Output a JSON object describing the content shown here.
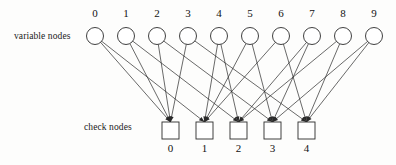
{
  "figure": {
    "type": "tanner-graph",
    "variable_nodes_label": "variable nodes",
    "check_nodes_label": "check nodes",
    "background_color": "#fdfdfc",
    "line_color": "#2a2a2a",
    "node_fill": "#ffffff",
    "node_stroke": "#2b2b2b"
  },
  "variable_nodes": {
    "count": 10,
    "labels": [
      "0",
      "1",
      "2",
      "3",
      "4",
      "5",
      "6",
      "7",
      "8",
      "9"
    ],
    "radius": 8.5,
    "center_y": 36,
    "label_y": 17,
    "x_positions": [
      95,
      126,
      157,
      188,
      219,
      250,
      281,
      312,
      343,
      374
    ]
  },
  "check_nodes": {
    "count": 5,
    "labels": [
      "0",
      "1",
      "2",
      "3",
      "4"
    ],
    "box_size": 17,
    "box_top": 122,
    "label_y": 152,
    "x_positions": [
      162,
      196,
      230,
      264,
      298
    ]
  },
  "chart_data": {
    "type": "diagram",
    "variable_node_degree": 2,
    "check_node_degree": 4,
    "edges": [
      {
        "variable": 0,
        "check": 0
      },
      {
        "variable": 0,
        "check": 1
      },
      {
        "variable": 1,
        "check": 0
      },
      {
        "variable": 1,
        "check": 2
      },
      {
        "variable": 2,
        "check": 0
      },
      {
        "variable": 2,
        "check": 3
      },
      {
        "variable": 3,
        "check": 0
      },
      {
        "variable": 3,
        "check": 4
      },
      {
        "variable": 4,
        "check": 1
      },
      {
        "variable": 4,
        "check": 2
      },
      {
        "variable": 5,
        "check": 1
      },
      {
        "variable": 5,
        "check": 3
      },
      {
        "variable": 6,
        "check": 1
      },
      {
        "variable": 6,
        "check": 4
      },
      {
        "variable": 7,
        "check": 2
      },
      {
        "variable": 7,
        "check": 3
      },
      {
        "variable": 8,
        "check": 2
      },
      {
        "variable": 8,
        "check": 4
      },
      {
        "variable": 9,
        "check": 3
      },
      {
        "variable": 9,
        "check": 4
      }
    ]
  }
}
